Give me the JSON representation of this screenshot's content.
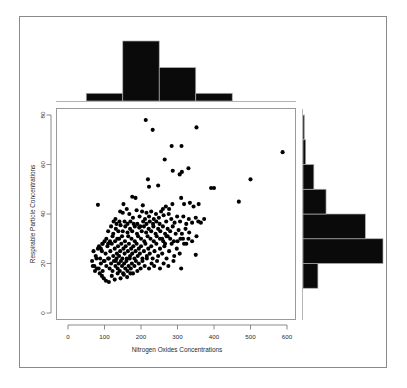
{
  "figure": {
    "type": "scatterplot-with-marginal-histograms",
    "background": "#ffffff",
    "frame_color": "#8a8a8a",
    "point_color": "#000000",
    "bar_color": "#0a0a0a"
  },
  "labels": {
    "xlabel": "Nitrogen Oxides Concentrations",
    "ylabel": "Respirable Particle Concentrations"
  },
  "axes": {
    "x_ticks": [
      "0",
      "100",
      "200",
      "300",
      "400",
      "500",
      "600"
    ],
    "y_ticks": [
      "0",
      "20",
      "40",
      "60",
      "80"
    ]
  },
  "chart_data": {
    "type": "scatter",
    "title": "",
    "xlabel": "Nitrogen Oxides Concentrations",
    "ylabel": "Respirable Particle Concentrations",
    "xlim": [
      0,
      625
    ],
    "ylim": [
      0,
      82
    ],
    "xticks": [
      0,
      100,
      200,
      300,
      400,
      500,
      600
    ],
    "yticks": [
      0,
      20,
      40,
      60,
      80
    ],
    "grid": false,
    "legend": "none",
    "marginal_histograms": {
      "top": {
        "orientation": "vertical",
        "bin_edges": [
          50,
          150,
          250,
          350,
          450
        ],
        "counts": [
          18,
          140,
          78,
          18
        ],
        "note": "x-distribution of Nitrogen Oxides Concentrations"
      },
      "right": {
        "orientation": "horizontal",
        "bin_edges": [
          10,
          20,
          30,
          40,
          50,
          60,
          70,
          80
        ],
        "counts": [
          22,
          118,
          92,
          34,
          16,
          4,
          2
        ],
        "note": "y-distribution of Respirable Particle Concentrations"
      }
    },
    "points": [
      [
        213,
        78
      ],
      [
        232,
        74
      ],
      [
        352,
        75
      ],
      [
        284,
        67.5
      ],
      [
        311,
        67.5
      ],
      [
        265,
        62
      ],
      [
        588,
        65
      ],
      [
        287,
        57.5
      ],
      [
        306,
        56
      ],
      [
        312,
        57
      ],
      [
        330,
        58.5
      ],
      [
        219,
        54
      ],
      [
        500,
        54
      ],
      [
        222,
        51
      ],
      [
        247,
        51.5
      ],
      [
        392,
        50.5
      ],
      [
        400,
        50.5
      ],
      [
        310,
        46.5
      ],
      [
        468,
        45
      ],
      [
        82,
        43.7
      ],
      [
        176,
        47
      ],
      [
        185,
        46.5
      ],
      [
        152,
        44
      ],
      [
        205,
        43.5
      ],
      [
        286,
        44
      ],
      [
        318,
        44
      ],
      [
        334,
        44.5
      ],
      [
        344,
        43
      ],
      [
        358,
        44
      ],
      [
        130,
        38
      ],
      [
        143,
        41
      ],
      [
        150,
        40.5
      ],
      [
        161,
        42
      ],
      [
        168,
        40
      ],
      [
        178,
        38.5
      ],
      [
        188,
        41.5
      ],
      [
        196,
        39
      ],
      [
        203,
        41
      ],
      [
        211,
        38
      ],
      [
        215,
        40.5
      ],
      [
        222,
        39
      ],
      [
        228,
        41
      ],
      [
        235,
        38
      ],
      [
        241,
        40
      ],
      [
        249,
        38.5
      ],
      [
        255,
        41
      ],
      [
        262,
        39.5
      ],
      [
        269,
        37
      ],
      [
        276,
        40
      ],
      [
        283,
        38
      ],
      [
        292,
        36.5
      ],
      [
        299,
        39
      ],
      [
        307,
        37
      ],
      [
        316,
        39
      ],
      [
        324,
        36
      ],
      [
        331,
        38
      ],
      [
        340,
        36.5
      ],
      [
        350,
        38.5
      ],
      [
        357,
        37
      ],
      [
        364,
        36.5
      ],
      [
        373,
        38
      ],
      [
        110,
        33
      ],
      [
        118,
        35
      ],
      [
        124,
        32
      ],
      [
        131,
        34
      ],
      [
        138,
        33
      ],
      [
        144,
        35.5
      ],
      [
        150,
        33
      ],
      [
        157,
        35
      ],
      [
        163,
        32.5
      ],
      [
        170,
        34
      ],
      [
        176,
        33
      ],
      [
        183,
        35
      ],
      [
        189,
        32
      ],
      [
        195,
        34.5
      ],
      [
        202,
        33
      ],
      [
        208,
        35
      ],
      [
        214,
        32.5
      ],
      [
        221,
        34
      ],
      [
        228,
        33
      ],
      [
        234,
        35
      ],
      [
        240,
        32
      ],
      [
        247,
        34
      ],
      [
        253,
        33
      ],
      [
        260,
        35
      ],
      [
        266,
        32
      ],
      [
        273,
        34
      ],
      [
        280,
        33
      ],
      [
        287,
        35
      ],
      [
        295,
        32
      ],
      [
        303,
        33.5
      ],
      [
        312,
        32
      ],
      [
        322,
        34
      ],
      [
        332,
        32.5
      ],
      [
        70,
        25
      ],
      [
        76,
        23
      ],
      [
        82,
        26
      ],
      [
        88,
        22
      ],
      [
        93,
        25
      ],
      [
        98,
        21
      ],
      [
        103,
        24
      ],
      [
        108,
        27
      ],
      [
        112,
        22
      ],
      [
        116,
        25
      ],
      [
        120,
        28
      ],
      [
        124,
        23
      ],
      [
        128,
        26
      ],
      [
        131,
        21
      ],
      [
        134,
        24
      ],
      [
        137,
        27
      ],
      [
        140,
        23
      ],
      [
        143,
        25
      ],
      [
        146,
        28
      ],
      [
        149,
        22
      ],
      [
        152,
        26
      ],
      [
        155,
        24
      ],
      [
        158,
        27
      ],
      [
        161,
        22
      ],
      [
        164,
        25
      ],
      [
        167,
        28
      ],
      [
        170,
        23
      ],
      [
        173,
        26
      ],
      [
        176,
        24
      ],
      [
        179,
        27
      ],
      [
        182,
        22
      ],
      [
        185,
        25
      ],
      [
        188,
        28
      ],
      [
        191,
        23
      ],
      [
        194,
        26
      ],
      [
        197,
        24
      ],
      [
        200,
        27
      ],
      [
        204,
        22
      ],
      [
        208,
        25
      ],
      [
        212,
        28
      ],
      [
        216,
        23
      ],
      [
        220,
        26
      ],
      [
        224,
        24
      ],
      [
        228,
        27
      ],
      [
        232,
        22
      ],
      [
        237,
        25
      ],
      [
        242,
        28
      ],
      [
        247,
        23
      ],
      [
        252,
        26
      ],
      [
        258,
        24
      ],
      [
        264,
        27
      ],
      [
        270,
        22
      ],
      [
        277,
        25
      ],
      [
        284,
        28
      ],
      [
        291,
        23
      ],
      [
        298,
        26
      ],
      [
        306,
        24
      ],
      [
        315,
        30
      ],
      [
        324,
        28
      ],
      [
        66,
        21
      ],
      [
        72,
        19
      ],
      [
        78,
        22
      ],
      [
        84,
        18
      ],
      [
        90,
        20
      ],
      [
        95,
        17
      ],
      [
        100,
        21
      ],
      [
        105,
        19
      ],
      [
        110,
        22
      ],
      [
        114,
        18
      ],
      [
        118,
        20
      ],
      [
        122,
        17
      ],
      [
        126,
        21
      ],
      [
        130,
        19
      ],
      [
        133,
        22
      ],
      [
        136,
        18
      ],
      [
        139,
        20
      ],
      [
        142,
        17
      ],
      [
        145,
        21
      ],
      [
        148,
        19
      ],
      [
        151,
        16
      ],
      [
        154,
        20
      ],
      [
        157,
        18
      ],
      [
        160,
        21
      ],
      [
        163,
        17
      ],
      [
        166,
        19
      ],
      [
        169,
        22
      ],
      [
        172,
        18
      ],
      [
        175,
        20
      ],
      [
        178,
        16
      ],
      [
        182,
        19
      ],
      [
        186,
        21
      ],
      [
        190,
        17
      ],
      [
        194,
        20
      ],
      [
        199,
        18
      ],
      [
        204,
        21
      ],
      [
        210,
        19
      ],
      [
        216,
        22
      ],
      [
        222,
        18
      ],
      [
        229,
        20
      ],
      [
        236,
        19
      ],
      [
        244,
        21
      ],
      [
        252,
        18
      ],
      [
        262,
        20
      ],
      [
        275,
        19
      ],
      [
        289,
        21
      ],
      [
        310,
        18
      ],
      [
        350,
        23.5
      ],
      [
        98,
        14
      ],
      [
        104,
        13
      ],
      [
        112,
        12.5
      ],
      [
        120,
        15
      ],
      [
        128,
        13.5
      ],
      [
        87,
        16
      ],
      [
        93,
        15
      ],
      [
        79,
        18
      ],
      [
        74,
        17
      ],
      [
        68,
        19
      ],
      [
        136,
        16
      ],
      [
        144,
        14
      ],
      [
        153,
        15.5
      ],
      [
        162,
        14.5
      ],
      [
        171,
        16
      ],
      [
        140,
        30
      ],
      [
        148,
        31
      ],
      [
        156,
        29
      ],
      [
        165,
        31
      ],
      [
        174,
        30
      ],
      [
        183,
        29
      ],
      [
        192,
        31
      ],
      [
        200,
        30
      ],
      [
        209,
        29
      ],
      [
        218,
        31
      ],
      [
        226,
        30
      ],
      [
        235,
        29
      ],
      [
        243,
        31
      ],
      [
        252,
        30
      ],
      [
        261,
        29
      ],
      [
        270,
        31
      ],
      [
        280,
        30
      ],
      [
        290,
        29
      ],
      [
        115,
        29
      ],
      [
        122,
        31
      ],
      [
        129,
        29
      ],
      [
        135,
        30
      ],
      [
        105,
        30
      ],
      [
        110,
        28
      ],
      [
        100,
        29
      ],
      [
        94,
        28
      ],
      [
        190,
        36
      ],
      [
        198,
        35
      ],
      [
        206,
        37
      ],
      [
        215,
        36
      ],
      [
        224,
        37
      ],
      [
        233,
        36
      ],
      [
        242,
        37
      ],
      [
        251,
        36
      ],
      [
        155,
        37
      ],
      [
        163,
        36
      ],
      [
        171,
        37
      ],
      [
        180,
        36
      ],
      [
        260,
        42
      ],
      [
        268,
        43
      ],
      [
        277,
        42
      ],
      [
        125,
        37
      ],
      [
        133,
        36
      ],
      [
        141,
        37
      ],
      [
        85,
        27
      ],
      [
        90,
        26
      ],
      [
        95,
        28
      ],
      [
        258,
        30
      ],
      [
        266,
        28
      ],
      [
        273,
        31
      ],
      [
        300,
        29
      ],
      [
        308,
        30
      ],
      [
        318,
        28
      ],
      [
        330,
        30
      ],
      [
        340,
        29
      ],
      [
        352,
        31
      ]
    ]
  }
}
